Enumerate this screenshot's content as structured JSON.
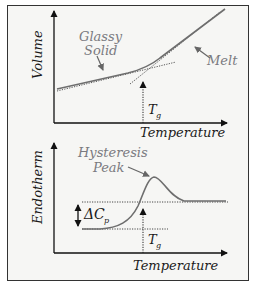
{
  "top_panel": {
    "y_axis_label": "Volume",
    "x_axis_label": "Temperature",
    "annotations": {
      "glassy_line1": "Glassy",
      "glassy_line2": "Solid",
      "melt": "Melt",
      "tg_main": "T",
      "tg_sub": "g"
    }
  },
  "bottom_panel": {
    "y_axis_label": "Endotherm",
    "x_axis_label": "Temperature",
    "annotations": {
      "peak_line1": "Hysteresis",
      "peak_line2": "Peak",
      "delta_cp_main": "ΔC",
      "delta_cp_sub": "p",
      "tg_main": "T",
      "tg_sub": "g"
    }
  },
  "colors": {
    "curve": "#6e6e6e",
    "axis": "#111111",
    "label_gray": "#7a7a80",
    "background": "#f6f6f4"
  }
}
